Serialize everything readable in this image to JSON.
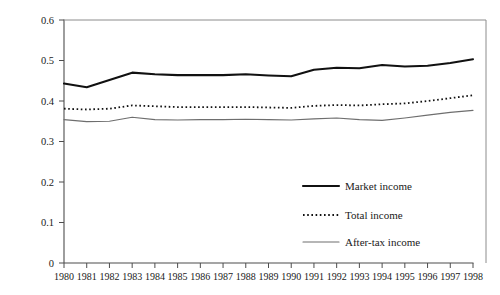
{
  "chart_data": {
    "type": "line",
    "title": "",
    "subtitle": "",
    "xlabel": "",
    "ylabel": "",
    "xlim": [
      1980,
      1998
    ],
    "ylim": [
      0,
      0.6
    ],
    "grid": false,
    "legend_position": "inside-bottom-right",
    "x": [
      1980,
      1981,
      1982,
      1983,
      1984,
      1985,
      1986,
      1987,
      1988,
      1989,
      1990,
      1991,
      1992,
      1993,
      1994,
      1995,
      1996,
      1997,
      1998
    ],
    "xtick_labels": [
      "1980",
      "1981",
      "1982",
      "1983",
      "1984",
      "1985",
      "1986",
      "1987",
      "1988",
      "1989",
      "1990",
      "1991",
      "1992",
      "1993",
      "1994",
      "1995",
      "1996",
      "1997",
      "1998"
    ],
    "ytick_labels": [
      "0",
      "0.1",
      "0.2",
      "0.3",
      "0.4",
      "0.5",
      "0.6"
    ],
    "ytick_values": [
      0,
      0.1,
      0.2,
      0.3,
      0.4,
      0.5,
      0.6
    ],
    "series": [
      {
        "name": "Market income",
        "style": "solid-thick",
        "color": "#111111",
        "values": [
          0.443,
          0.434,
          0.452,
          0.47,
          0.466,
          0.464,
          0.464,
          0.464,
          0.466,
          0.463,
          0.461,
          0.477,
          0.482,
          0.481,
          0.489,
          0.485,
          0.487,
          0.494,
          0.503
        ]
      },
      {
        "name": "Total income",
        "style": "dotted",
        "color": "#111111",
        "values": [
          0.381,
          0.379,
          0.381,
          0.389,
          0.387,
          0.385,
          0.385,
          0.385,
          0.385,
          0.384,
          0.383,
          0.388,
          0.39,
          0.389,
          0.392,
          0.394,
          0.4,
          0.407,
          0.414
        ]
      },
      {
        "name": "After-tax income",
        "style": "solid-thin",
        "color": "#6e6e6e",
        "values": [
          0.354,
          0.349,
          0.35,
          0.36,
          0.354,
          0.353,
          0.354,
          0.354,
          0.355,
          0.354,
          0.353,
          0.356,
          0.358,
          0.354,
          0.352,
          0.358,
          0.365,
          0.372,
          0.377
        ]
      }
    ]
  },
  "legend": {
    "entries": [
      {
        "label": "Market income"
      },
      {
        "label": "Total income"
      },
      {
        "label": "After-tax income"
      }
    ]
  }
}
